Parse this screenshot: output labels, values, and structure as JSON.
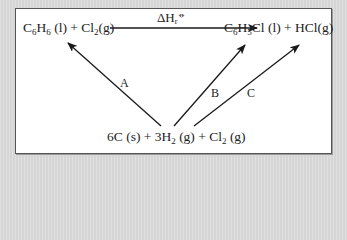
{
  "diagram": {
    "type": "hess-cycle",
    "reactants": {
      "parts": [
        {
          "text": "C",
          "sub": "6"
        },
        {
          "text": "H",
          "sub": "6"
        },
        {
          "text": " (l) + Cl",
          "sub": "2"
        },
        {
          "text": "(g)",
          "sub": ""
        }
      ],
      "full": "C6H6 (l) + Cl2(g)"
    },
    "products": {
      "parts": [
        {
          "text": "C",
          "sub": "6"
        },
        {
          "text": "H",
          "sub": "5"
        },
        {
          "text": "Cl (l) + HCl(g)",
          "sub": ""
        }
      ],
      "full": "C6H5Cl (l) + HCl(g)"
    },
    "elements": {
      "parts": [
        {
          "text": "6C (s) + 3H",
          "sub": "2"
        },
        {
          "text": " (g) + Cl",
          "sub": "2"
        },
        {
          "text": " (g)",
          "sub": ""
        }
      ],
      "full": "6C (s) + 3H2 (g) + Cl2 (g)"
    },
    "enthalpy_label": {
      "delta": "ΔH",
      "sub": "r",
      "sup": "⦵",
      "full": "ΔHr⦵"
    },
    "arrows": [
      {
        "id": "top",
        "label": "",
        "from": "reactants",
        "to": "products"
      },
      {
        "id": "A",
        "label": "A",
        "from": "elements",
        "to": "reactants"
      },
      {
        "id": "B",
        "label": "B",
        "from": "elements",
        "to": "products"
      },
      {
        "id": "C",
        "label": "C",
        "from": "elements",
        "to": "products"
      }
    ],
    "colors": {
      "line": "#1a1a1a",
      "text": "#222222",
      "panel": "#ffffff",
      "background": "#dcdcdc"
    }
  }
}
